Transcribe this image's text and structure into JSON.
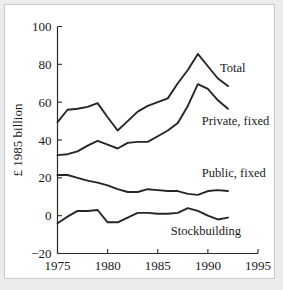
{
  "chart_data": {
    "type": "line",
    "title": "",
    "xlabel": "",
    "ylabel": "£ 1985 billion",
    "xlim": [
      1975,
      1995
    ],
    "ylim": [
      -20,
      100
    ],
    "xticks": [
      1975,
      1980,
      1985,
      1990,
      1995
    ],
    "xticklabels": [
      "1975",
      "1980",
      "1985",
      "1990",
      "1995"
    ],
    "yticks": [
      -20,
      0,
      20,
      40,
      60,
      80,
      100
    ],
    "yticklabels": [
      "-20",
      "0",
      "20",
      "40",
      "60",
      "80",
      "100"
    ],
    "grid": false,
    "legend_position": "inline-right-of-series",
    "line_color": "#262626",
    "x": [
      1975,
      1976,
      1977,
      1978,
      1979,
      1980,
      1981,
      1982,
      1983,
      1984,
      1985,
      1986,
      1987,
      1988,
      1989,
      1990,
      1991,
      1992
    ],
    "series": [
      {
        "name": "Total",
        "label": "Total",
        "label_x": 1991.2,
        "label_y": 76,
        "values": [
          49.5,
          56,
          56.5,
          57.5,
          59.5,
          52,
          45,
          50,
          55,
          58,
          60,
          62,
          70,
          77,
          85.5,
          79,
          72.5,
          68.5
        ]
      },
      {
        "name": "Private, fixed",
        "label": "Private, fixed",
        "label_x": 1989.4,
        "label_y": 48,
        "values": [
          32,
          32.5,
          34,
          37,
          39.5,
          37.5,
          35.5,
          38.5,
          39,
          39,
          42,
          45,
          49,
          58,
          69.5,
          67,
          61,
          56.5
        ]
      },
      {
        "name": "Public, fixed",
        "label": "Public, fixed",
        "label_x": 1989.4,
        "label_y": 20.5,
        "values": [
          21.5,
          21.5,
          20,
          18.5,
          17.5,
          16,
          14,
          12.5,
          12.5,
          14,
          13.5,
          13,
          13,
          11.5,
          11,
          13,
          13.5,
          13
        ]
      },
      {
        "name": "Stockbuilding",
        "label": "Stockbuilding",
        "label_x": 1986.3,
        "label_y": -10,
        "values": [
          -4,
          -0.5,
          2.5,
          2.5,
          3,
          -3.5,
          -3.5,
          -1,
          1.5,
          1.5,
          1,
          1,
          1.5,
          4,
          2.5,
          0,
          -2,
          -1
        ]
      }
    ]
  }
}
